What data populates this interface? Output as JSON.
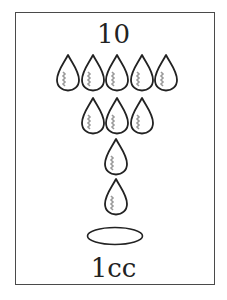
{
  "card": {
    "top_label": "10",
    "bottom_label": "1cc"
  },
  "drops": {
    "rows": [
      5,
      3,
      1,
      1
    ],
    "stroke_color": "#222222",
    "shade_color": "#9a9a9a"
  },
  "icons": [
    "water-drop-icon",
    "ellipse-puddle-icon"
  ]
}
